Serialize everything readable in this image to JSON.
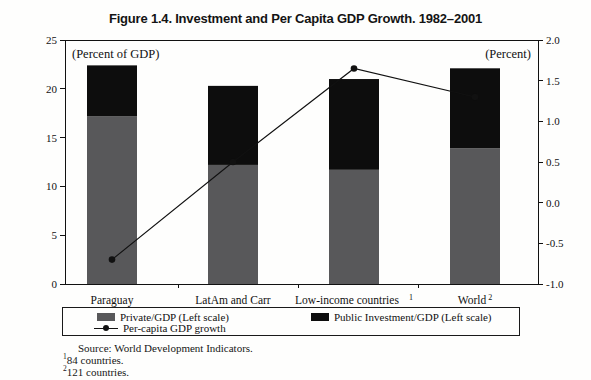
{
  "title": "Figure 1.4. Investment and Per Capita GDP Growth. 1982–2001",
  "chart_data": {
    "type": "bar",
    "subtype": "stacked bars with line overlay, dual y-axes",
    "grid": false,
    "legend_position": "bottom boxed",
    "categories": [
      {
        "label": "Paraguay",
        "sup": ""
      },
      {
        "label": "LatAm and Carr",
        "sup": ""
      },
      {
        "label": "Low-income countries",
        "sup": "1"
      },
      {
        "label": "World",
        "sup": "2"
      }
    ],
    "series": [
      {
        "name": "Private/GDP (Left scale)",
        "axis": "left",
        "color": "#58585a",
        "values": [
          17.2,
          12.2,
          11.7,
          13.9
        ]
      },
      {
        "name": "Public Investment/GDP (Left scale)",
        "axis": "left",
        "color": "#0d0d0d",
        "values": [
          5.2,
          8.1,
          9.3,
          8.2
        ]
      }
    ],
    "line_series": {
      "name": "Per-capita GDP growth",
      "axis": "right",
      "color": "#111111",
      "values": [
        -0.7,
        0.5,
        1.65,
        1.3
      ]
    },
    "left_axis": {
      "label": "(Percent of GDP)",
      "min": 0,
      "max": 25,
      "ticks": [
        0,
        5,
        10,
        15,
        20,
        25
      ]
    },
    "right_axis": {
      "label": "(Percent)",
      "min": -1.0,
      "max": 2.0,
      "ticks": [
        "2.0",
        "1.5",
        "1.0",
        "0.5",
        "0.0",
        "-0.5",
        "-1.0"
      ]
    }
  },
  "footer": {
    "source": "Source: World Development Indicators.",
    "notes": [
      {
        "sup": "1",
        "text": "84 countries."
      },
      {
        "sup": "2",
        "text": "121 countries."
      }
    ]
  }
}
